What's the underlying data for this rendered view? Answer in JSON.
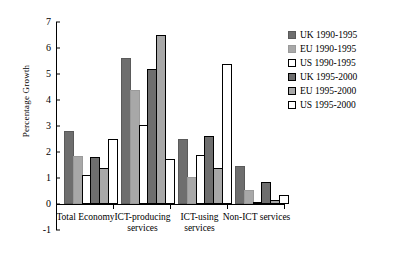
{
  "chart_data": {
    "type": "bar",
    "title": "",
    "xlabel": "",
    "ylabel": "Percentage Growth",
    "ylim": [
      -1,
      7
    ],
    "yticks": [
      "-1",
      "0",
      "1",
      "2",
      "3",
      "4",
      "5",
      "6",
      "7"
    ],
    "grid": false,
    "legend_position": "right",
    "categories": [
      "Total Economy",
      "ICT-producing services",
      "ICT-using services",
      "Non-ICT services"
    ],
    "series": [
      {
        "name": "UK 1990-1995",
        "color": "#6e6e6e",
        "values": [
          2.8,
          5.6,
          2.5,
          1.45
        ]
      },
      {
        "name": "EU 1990-1995",
        "color": "#a8a8a8",
        "values": [
          1.85,
          4.4,
          1.05,
          0.55
        ]
      },
      {
        "name": "US 1990-1995",
        "color": "#ffffff",
        "values": [
          1.1,
          3.05,
          1.9,
          0.0
        ]
      },
      {
        "name": "UK 1995-2000",
        "color": "#6e6e6e",
        "values": [
          1.8,
          5.2,
          2.6,
          0.85
        ]
      },
      {
        "name": "EU 1995-2000",
        "color": "#a8a8a8",
        "values": [
          1.4,
          6.5,
          1.4,
          0.15
        ]
      },
      {
        "name": "US 1995-2000",
        "color": "#ffffff",
        "values": [
          2.5,
          1.75,
          5.4,
          0.35
        ]
      }
    ]
  },
  "legend": {
    "items": [
      {
        "label": "UK 1990-1995"
      },
      {
        "label": "EU 1990-1995"
      },
      {
        "label": "US 1990-1995"
      },
      {
        "label": "UK 1995-2000"
      },
      {
        "label": "EU 1995-2000"
      },
      {
        "label": "US 1995-2000"
      }
    ]
  }
}
